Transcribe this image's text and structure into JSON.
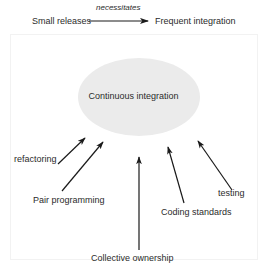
{
  "figure": {
    "top_flow": {
      "source_label": "Small releases",
      "relation_label": "necessitates",
      "target_label": "Frequent integration"
    },
    "center_node": {
      "label": "Continuous integration",
      "fill_color": "#ebebeb"
    },
    "practices": [
      {
        "label": "refactoring"
      },
      {
        "label": "Pair programming"
      },
      {
        "label": "Collective ownership"
      },
      {
        "label": "Coding standards"
      },
      {
        "label": "testing"
      }
    ],
    "colors": {
      "arrow": "#1a1a1a",
      "text": "#2b2b2b",
      "frame": "#f2f2f2",
      "background": "#ffffff"
    }
  }
}
